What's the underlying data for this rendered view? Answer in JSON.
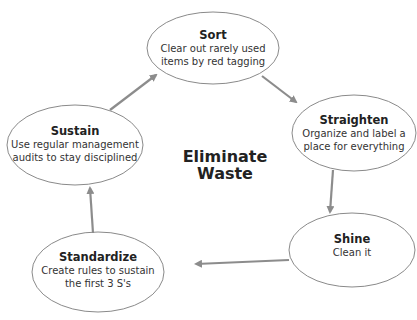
{
  "diagram": {
    "center_label_line1": "Eliminate",
    "center_label_line2": "Waste",
    "nodes": [
      {
        "id": "sort",
        "title": "Sort",
        "desc_line1": "Clear out rarely used",
        "desc_line2": "items by red tagging"
      },
      {
        "id": "straighten",
        "title": "Straighten",
        "desc_line1": "Organize and label a",
        "desc_line2": "place for everything"
      },
      {
        "id": "shine",
        "title": "Shine",
        "desc_line1": "Clean it",
        "desc_line2": ""
      },
      {
        "id": "standardize",
        "title": "Standardize",
        "desc_line1": "Create rules to sustain",
        "desc_line2": "the first 3 S's"
      },
      {
        "id": "sustain",
        "title": "Sustain",
        "desc_line1": "Use regular management",
        "desc_line2": "audits to stay disciplined"
      }
    ],
    "colors": {
      "ellipse_stroke": "#8a8a8a",
      "arrow": "#8c8c8c",
      "text": "#222222"
    }
  }
}
